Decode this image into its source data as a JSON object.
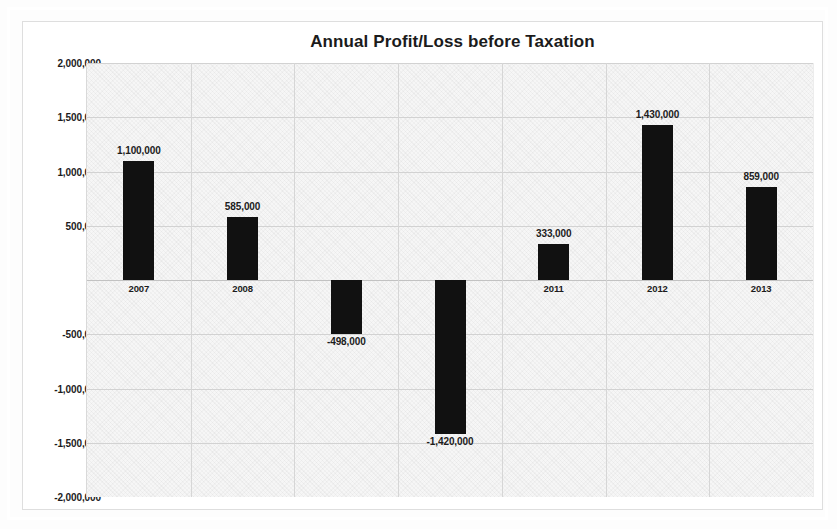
{
  "chart_data": {
    "type": "bar",
    "title": "Annual Profit/Loss before Taxation",
    "xlabel": "",
    "ylabel": "",
    "categories": [
      "2007",
      "2008",
      "2009",
      "2010",
      "2011",
      "2012",
      "2013"
    ],
    "values": [
      1100000,
      585000,
      -498000,
      -1420000,
      333000,
      1430000,
      859000
    ],
    "data_labels": [
      "1,100,000",
      "585,000",
      "-498,000",
      "-1,420,000",
      "333,000",
      "1,430,000",
      "859,000"
    ],
    "ylim": [
      -2000000,
      2000000
    ],
    "ytick_values": [
      2000000,
      1500000,
      1000000,
      500000,
      0,
      -500000,
      -1000000,
      -1500000,
      -2000000
    ],
    "ytick_labels": [
      "2,000,000",
      "1,500,000",
      "1,000,000",
      "500,000",
      "-",
      "-500,000",
      "-1,000,000",
      "-1,500,000",
      "-2,000,000"
    ],
    "grid": true,
    "legend": false,
    "series_color": "#111111",
    "plot_background": "#f6f6f6",
    "gridline_color": "#d2d2d2"
  }
}
